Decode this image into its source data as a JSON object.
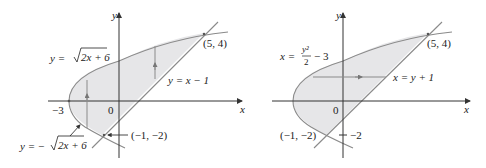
{
  "left_panel": {
    "y_axis_label": "y",
    "x_axis_label": "x",
    "origin_label": "0",
    "neg3_label": "−3",
    "upper_curve_label_prefix": "y = ",
    "upper_curve_label_radicand": "2x + 6",
    "lower_curve_label_prefix": "y = −",
    "lower_curve_label_radicand": "2x + 6",
    "line_label": "y = x − 1",
    "point_upper": "(5, 4)",
    "point_lower": "(−1, −2)"
  },
  "right_panel": {
    "y_axis_label": "y",
    "x_axis_label": "x",
    "origin_label": "0",
    "neg2_label": "−2",
    "curve_label_prefix": "x = ",
    "curve_label_num": "y²",
    "curve_label_den": "2",
    "curve_label_suffix": "− 3",
    "line_label": "x = y + 1",
    "point_upper": "(5, 4)",
    "point_lower": "(−1, −2)"
  },
  "colors": {
    "region_fill": "#e6e6e8",
    "curve_stroke": "#8a8a8a",
    "axis_stroke": "#333333",
    "text": "#222222"
  }
}
